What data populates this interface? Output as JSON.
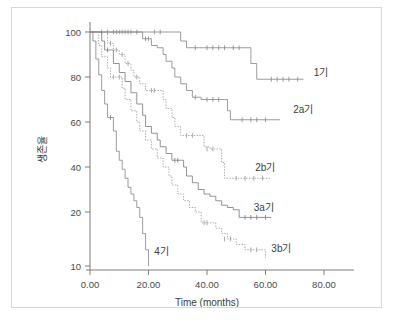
{
  "chart_data": {
    "type": "line",
    "title": "",
    "xlabel": "Time (months)",
    "ylabel": "생존율",
    "xlim": [
      0,
      85
    ],
    "ylim": [
      10,
      102
    ],
    "xticks": [
      "0.00",
      "20.00",
      "40.00",
      "60.00",
      "80.00"
    ],
    "xtick_values": [
      0,
      20,
      40,
      60,
      80
    ],
    "yticks": [
      "100",
      "80",
      "60",
      "40",
      "20",
      "10"
    ],
    "ytick_values": [
      100,
      80,
      60,
      40,
      20,
      10
    ],
    "grid": false,
    "legend_position": "right-inline",
    "series": [
      {
        "name": "1기",
        "label": "1기",
        "style": "solid",
        "color": "#8a8a8a",
        "label_x": 76.5,
        "label_y": 82,
        "points": [
          [
            0,
            100
          ],
          [
            30,
            100
          ],
          [
            31,
            96
          ],
          [
            33,
            93
          ],
          [
            47,
            93
          ],
          [
            48,
            93
          ],
          [
            54,
            93
          ],
          [
            55,
            86
          ],
          [
            57,
            79
          ],
          [
            73,
            79
          ]
        ],
        "censors": [
          [
            4,
            100
          ],
          [
            6,
            100
          ],
          [
            8,
            100
          ],
          [
            10,
            100
          ],
          [
            12,
            100
          ],
          [
            14,
            100
          ],
          [
            16,
            100
          ],
          [
            22,
            100
          ],
          [
            24,
            100
          ],
          [
            36,
            93
          ],
          [
            40,
            93
          ],
          [
            42,
            93
          ],
          [
            44,
            93
          ],
          [
            46,
            93
          ],
          [
            49,
            93
          ],
          [
            51,
            93
          ],
          [
            62,
            79
          ],
          [
            64,
            79
          ],
          [
            66,
            79
          ],
          [
            68,
            79
          ],
          [
            71,
            79
          ]
        ]
      },
      {
        "name": "2a기",
        "label": "2a기",
        "style": "solid",
        "color": "#8a8a8a",
        "label_x": 69.5,
        "label_y": 65.5,
        "points": [
          [
            0,
            100
          ],
          [
            17,
            100
          ],
          [
            18,
            97
          ],
          [
            21,
            94
          ],
          [
            23,
            93
          ],
          [
            25,
            90
          ],
          [
            26,
            87
          ],
          [
            28,
            84
          ],
          [
            29,
            80
          ],
          [
            31,
            77
          ],
          [
            33,
            74
          ],
          [
            35,
            71
          ],
          [
            38,
            70
          ],
          [
            46,
            70
          ],
          [
            47,
            65
          ],
          [
            48,
            61
          ],
          [
            65,
            61
          ]
        ],
        "censors": [
          [
            9,
            100
          ],
          [
            11,
            100
          ],
          [
            13,
            100
          ],
          [
            19,
            97
          ],
          [
            20,
            97
          ],
          [
            36,
            71
          ],
          [
            40,
            70
          ],
          [
            42,
            70
          ],
          [
            44,
            70
          ],
          [
            52,
            61
          ],
          [
            55,
            61
          ],
          [
            57,
            61
          ],
          [
            60,
            61
          ]
        ]
      },
      {
        "name": "2b기",
        "label": "2b기",
        "style": "dotted",
        "color": "#9a9a9a",
        "label_x": 56.5,
        "label_y": 40,
        "points": [
          [
            0,
            100
          ],
          [
            5,
            100
          ],
          [
            6,
            95
          ],
          [
            8,
            92
          ],
          [
            10,
            90
          ],
          [
            12,
            86
          ],
          [
            14,
            83
          ],
          [
            15,
            80
          ],
          [
            17,
            77
          ],
          [
            19,
            74
          ],
          [
            24,
            74
          ],
          [
            25,
            70
          ],
          [
            26,
            66
          ],
          [
            28,
            62
          ],
          [
            29,
            58
          ],
          [
            31,
            54
          ],
          [
            38,
            54
          ],
          [
            39,
            49
          ],
          [
            41,
            48
          ],
          [
            44,
            48
          ],
          [
            45,
            42
          ],
          [
            46,
            35
          ],
          [
            62,
            35
          ]
        ],
        "censors": [
          [
            7,
            95
          ],
          [
            9,
            92
          ],
          [
            11,
            90
          ],
          [
            13,
            86
          ],
          [
            16,
            80
          ],
          [
            21,
            74
          ],
          [
            22,
            74
          ],
          [
            33,
            54
          ],
          [
            35,
            54
          ],
          [
            40,
            48
          ],
          [
            42,
            48
          ],
          [
            50,
            35
          ],
          [
            53,
            35
          ],
          [
            56,
            35
          ],
          [
            59,
            35
          ]
        ]
      },
      {
        "name": "3a기",
        "label": "3a기",
        "style": "solid",
        "color": "#7f7f7f",
        "label_x": 56,
        "label_y": 22,
        "points": [
          [
            0,
            100
          ],
          [
            3,
            100
          ],
          [
            4,
            96
          ],
          [
            5,
            92
          ],
          [
            7,
            92
          ],
          [
            8,
            86
          ],
          [
            10,
            82
          ],
          [
            12,
            78
          ],
          [
            14,
            73
          ],
          [
            16,
            68
          ],
          [
            18,
            63
          ],
          [
            19,
            58
          ],
          [
            21,
            55
          ],
          [
            23,
            52
          ],
          [
            24,
            49
          ],
          [
            26,
            46
          ],
          [
            28,
            43
          ],
          [
            31,
            43
          ],
          [
            32,
            40
          ],
          [
            33,
            36
          ],
          [
            35,
            33
          ],
          [
            37,
            30
          ],
          [
            39,
            28
          ],
          [
            41,
            27
          ],
          [
            43,
            25
          ],
          [
            45,
            23
          ],
          [
            47,
            22
          ],
          [
            49,
            21
          ],
          [
            51,
            19
          ],
          [
            62,
            19
          ]
        ],
        "censors": [
          [
            6,
            92
          ],
          [
            29,
            43
          ],
          [
            30,
            43
          ],
          [
            53,
            19
          ],
          [
            55,
            19
          ],
          [
            57,
            19
          ],
          [
            60,
            19
          ]
        ]
      },
      {
        "name": "3b기",
        "label": "3b기",
        "style": "dotted",
        "color": "#9a9a9a",
        "label_x": 62,
        "label_y": 13.2,
        "points": [
          [
            0,
            100
          ],
          [
            2,
            100
          ],
          [
            3,
            94
          ],
          [
            4,
            89
          ],
          [
            6,
            84
          ],
          [
            7,
            80
          ],
          [
            9,
            80
          ],
          [
            11,
            75
          ],
          [
            12,
            70
          ],
          [
            14,
            65
          ],
          [
            16,
            60
          ],
          [
            17,
            56
          ],
          [
            19,
            52
          ],
          [
            21,
            48
          ],
          [
            23,
            44
          ],
          [
            25,
            40
          ],
          [
            27,
            36
          ],
          [
            28,
            32
          ],
          [
            30,
            28
          ],
          [
            32,
            25
          ],
          [
            34,
            22
          ],
          [
            36,
            20
          ],
          [
            38,
            18
          ],
          [
            41,
            18
          ],
          [
            43,
            17
          ],
          [
            45,
            16
          ],
          [
            47,
            15
          ],
          [
            50,
            14
          ],
          [
            53,
            13
          ],
          [
            60,
            13
          ],
          [
            60,
            11.5
          ]
        ],
        "censors": [
          [
            8,
            80
          ],
          [
            10,
            80
          ],
          [
            39,
            18
          ],
          [
            40,
            18
          ],
          [
            46,
            15
          ],
          [
            48,
            15
          ],
          [
            55,
            13
          ],
          [
            57,
            13
          ]
        ]
      },
      {
        "name": "4기",
        "label": "4기",
        "style": "solid",
        "color": "#8a8a8a",
        "label_x": 22,
        "label_y": 12.6,
        "points": [
          [
            0,
            100
          ],
          [
            1,
            96
          ],
          [
            2,
            88
          ],
          [
            3,
            81
          ],
          [
            4,
            74
          ],
          [
            5,
            68
          ],
          [
            6,
            62
          ],
          [
            8,
            56
          ],
          [
            9,
            47
          ],
          [
            10,
            43
          ],
          [
            11,
            39
          ],
          [
            12,
            35
          ],
          [
            13,
            31
          ],
          [
            14,
            28
          ],
          [
            15,
            25
          ],
          [
            16,
            22
          ],
          [
            17,
            19
          ],
          [
            18,
            16
          ],
          [
            19,
            13
          ],
          [
            20,
            11
          ],
          [
            20,
            10
          ]
        ],
        "censors": [
          [
            7,
            62
          ]
        ]
      }
    ]
  },
  "axis": {
    "x_title": "Time (months)",
    "y_title": "생존율"
  }
}
